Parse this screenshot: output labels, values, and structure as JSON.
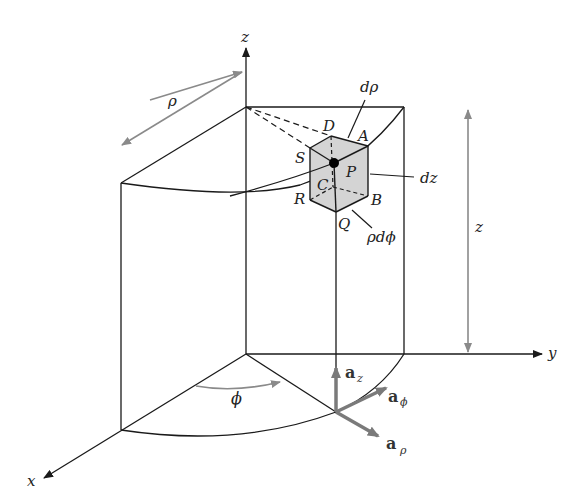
{
  "diagram": {
    "type": "cylindrical-coordinate-differential-volume",
    "colors": {
      "line": "#1a1a1a",
      "dim_arrow": "#8a8a8a",
      "unit_vector": "#7a7a7a",
      "volume_fill": "#d4d4d4"
    },
    "axes": {
      "x": "x",
      "y": "y",
      "z": "z"
    },
    "dimensions": {
      "rho": "ρ",
      "z": "z",
      "phi": "ϕ"
    },
    "element_labels": {
      "d_rho": "dρ",
      "dz": "dz",
      "rho_d_phi": "ρdϕ"
    },
    "points": {
      "A": "A",
      "B": "B",
      "C": "C",
      "D": "D",
      "P": "P",
      "Q": "Q",
      "R": "R",
      "S": "S"
    },
    "unit_vectors": {
      "az": {
        "base": "a",
        "sub": "z"
      },
      "aphi": {
        "base": "a",
        "sub": "ϕ"
      },
      "arho": {
        "base": "a",
        "sub": "ρ"
      }
    }
  }
}
